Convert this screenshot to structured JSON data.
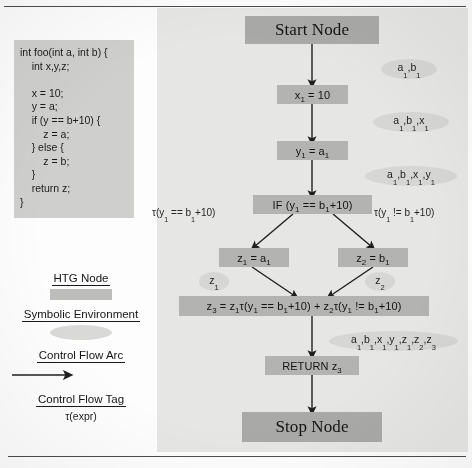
{
  "figure": {
    "code_listing": "int foo(int a, int b) {\n    int x,y,z;\n\n    x = 10;\n    y = a;\n    if (y == b+10) {\n        z = a;\n    } else {\n        z = b;\n    }\n    return z;\n}"
  },
  "graph": {
    "nodes": [
      {
        "id": "start",
        "label": "Start Node"
      },
      {
        "id": "assign-x",
        "label": "x1 = 10"
      },
      {
        "id": "assign-y",
        "label": "y1 = a1"
      },
      {
        "id": "if",
        "label": "IF (y1 == b1+10)"
      },
      {
        "id": "then",
        "label": "z1 = a1"
      },
      {
        "id": "else",
        "label": "z2 = b1"
      },
      {
        "id": "merge",
        "label": "z3 = z1τ(y1 == b1+10) + z2τ(y1 != b1+10)"
      },
      {
        "id": "return",
        "label": "RETURN z3"
      },
      {
        "id": "stop",
        "label": "Stop Node"
      }
    ],
    "environments": [
      {
        "id": "env-1",
        "label": "a1,b1"
      },
      {
        "id": "env-2",
        "label": "a1,b1,x1"
      },
      {
        "id": "env-3",
        "label": "a1,b1,x1,y1"
      },
      {
        "id": "env-then",
        "label": "z1"
      },
      {
        "id": "env-else",
        "label": "z2"
      },
      {
        "id": "env-final",
        "label": "a1,b1,x1,y1,z1,z2,z3"
      }
    ],
    "tags": [
      {
        "id": "tag-true",
        "label": "τ(y1 == b1+10)"
      },
      {
        "id": "tag-false",
        "label": "τ(y1 != b1+10)"
      }
    ]
  },
  "legend": {
    "items": [
      {
        "id": "htg-node",
        "label": "HTG Node",
        "shape": "rectangle-swatch"
      },
      {
        "id": "symbolic-environment",
        "label": "Symbolic Environment",
        "shape": "ellipse-swatch"
      },
      {
        "id": "control-flow-arc",
        "label": "Control Flow Arc",
        "shape": "arrow-swatch"
      },
      {
        "id": "control-flow-tag",
        "label": "Control Flow Tag",
        "shape": "tau-text"
      }
    ],
    "tag_example": "τ(expr)"
  },
  "colors": {
    "node_fill": "#b3b3b1",
    "terminal_fill": "#a9a9a7",
    "env_fill": "#d6d6d4",
    "code_fill": "#cfcfcd",
    "panel_bg": "#e6e6e4",
    "ink": "#1f1f1f"
  }
}
